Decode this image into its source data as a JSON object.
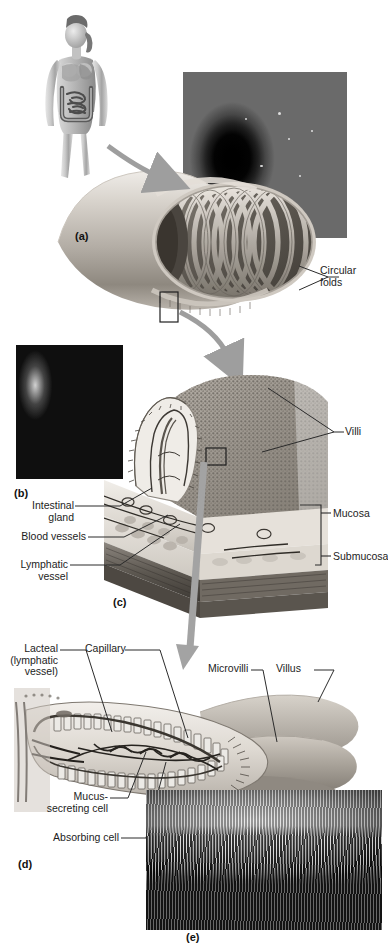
{
  "figure": {
    "background": "#ffffff",
    "label_color": "#1d1d1d",
    "leader_color": "#2b2b2b",
    "arrow_color": "#9a9a9a"
  },
  "panels": [
    {
      "id": "a",
      "label": "(a)",
      "caption": "Circular folds of the small intestine with endoscopic view"
    },
    {
      "id": "b",
      "label": "(b)",
      "caption": "Scanning electron micrograph of intestinal villi"
    },
    {
      "id": "c",
      "label": "(c)",
      "caption": "Wall of the small intestine showing villi, mucosa and submucosa"
    },
    {
      "id": "d",
      "label": "(d)",
      "caption": "Structure of a single villus"
    },
    {
      "id": "e",
      "label": "(e)",
      "caption": "Scanning electron micrograph of microvilli"
    }
  ],
  "labels": {
    "circular_folds": "Circular\nfolds",
    "villi": "Villi",
    "mucosa": "Mucosa",
    "submucosa": "Submucosa",
    "intestinal_gland": "Intestinal\ngland",
    "blood_vessels": "Blood vessels",
    "lymphatic_vessel": "Lymphatic\nvessel",
    "lacteal": "Lacteal\n(lymphatic\nvessel)",
    "capillary": "Capillary",
    "microvilli": "Microvilli",
    "villus": "Villus",
    "mucus_secreting_cell": "Mucus-\nsecreting cell",
    "absorbing_cell": "Absorbing cell"
  },
  "images": {
    "body_figure": "female-body-digestive-system-illustration",
    "endoscope_photo": "endoscopic-view-of-circular-folds",
    "sem_villi": "sem-micrograph-villi",
    "sem_microvilli": "sem-micrograph-microvilli",
    "intestine_tube": "cutaway-small-intestine-tube-illustration",
    "wall_block": "intestinal-wall-block-diagram",
    "villus_block": "villus-cross-section-illustration"
  },
  "icons": {
    "pointer_arrow": "curved-arrow-icon",
    "down_arrow": "down-arrow-icon",
    "callout_box": "callout-rectangle-icon"
  }
}
